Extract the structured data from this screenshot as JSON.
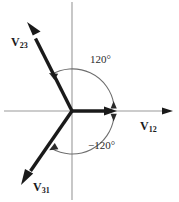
{
  "figure": {
    "origin": {
      "x": 72,
      "y": 111
    },
    "colors": {
      "axis": "#9a9a9a",
      "vector": "#1a1a1a",
      "arc": "#6e6e6e",
      "text": "#1a1a1a",
      "background": "#ffffff"
    },
    "axes": {
      "x_axis": {
        "x1": 4,
        "y1": 111,
        "x2": 174,
        "y2": 111,
        "arrow": "right"
      },
      "y_axis": {
        "x1": 72,
        "y1": 2,
        "x2": 72,
        "y2": 200,
        "arrow": "none"
      }
    },
    "vectors": [
      {
        "name": "v12",
        "label": "V",
        "subscript": "12",
        "angle_deg": 0,
        "tip": {
          "x": 172,
          "y": 111
        }
      },
      {
        "name": "v23",
        "label": "V",
        "subscript": "23",
        "angle_deg": 120,
        "tip": {
          "x": 27,
          "y": 22
        }
      },
      {
        "name": "v31",
        "label": "V",
        "subscript": "31",
        "angle_deg": -120,
        "tip": {
          "x": 21,
          "y": 186
        }
      }
    ],
    "angle_arcs": [
      {
        "name": "positive-120",
        "label": "120°",
        "value": 120,
        "direction": "counterclockwise",
        "from_deg": 0,
        "to_deg": 120
      },
      {
        "name": "negative-120",
        "label": "−120°",
        "value": -120,
        "direction": "clockwise",
        "from_deg": 0,
        "to_deg": -120
      }
    ]
  }
}
